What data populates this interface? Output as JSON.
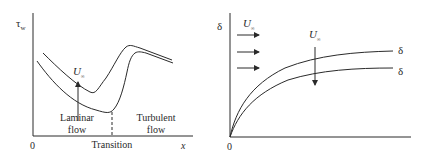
{
  "left_diagram": {
    "y_axis_label": "τ",
    "y_axis_label_sub": "w",
    "x_axis_label": "x",
    "origin_label": "0",
    "velocity_label": "U",
    "velocity_label_sub": "∞",
    "region_laminar_line1": "Laminar",
    "region_laminar_line2": "flow",
    "region_turbulent_line1": "Turbulent",
    "region_turbulent_line2": "flow",
    "transition_label": "Transition",
    "icons": {
      "velocity_arrow": "arrow-up-icon"
    }
  },
  "right_diagram": {
    "y_axis_label": "δ",
    "origin_label": "0",
    "inflow_label": "U",
    "inflow_label_sub": "∞",
    "velocity_label": "U",
    "velocity_label_sub": "∞",
    "curve_label_upper": "δ",
    "curve_label_lower": "δ",
    "icons": {
      "inflow_arrows": "arrow-right-icon",
      "velocity_arrow": "arrow-down-icon"
    }
  },
  "colors": {
    "line": "#2a2a2a",
    "background": "#ffffff"
  }
}
